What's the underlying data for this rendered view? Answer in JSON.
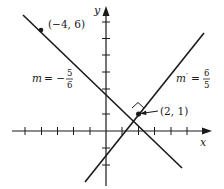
{
  "diagram": {
    "type": "coordinate-plane",
    "axes": {
      "x_label": "x",
      "y_label": "y",
      "x_ticks": [
        -5,
        -4,
        -3,
        -2,
        -1,
        1,
        2,
        3,
        4,
        5
      ],
      "y_ticks": [
        -2,
        -1,
        1,
        2,
        3,
        4,
        5,
        6
      ]
    },
    "points": [
      {
        "label": "(−4, 6)",
        "x": -4,
        "y": 6
      },
      {
        "label": "(2, 1)",
        "x": 2,
        "y": 1
      }
    ],
    "lines": [
      {
        "name": "m",
        "slope_label_prefix": "m = −",
        "slope_num": "5",
        "slope_den": "6",
        "slope": -0.8333
      },
      {
        "name": "m'",
        "slope_label_prefix": "m′ = ",
        "slope_num": "6",
        "slope_den": "5",
        "slope": 1.2
      }
    ],
    "annotations": {
      "right_angle_marker": true,
      "intersection_label": "(2, 1)"
    },
    "colors": {
      "ink": "#1a1a1a",
      "background": "#ffffff"
    }
  }
}
